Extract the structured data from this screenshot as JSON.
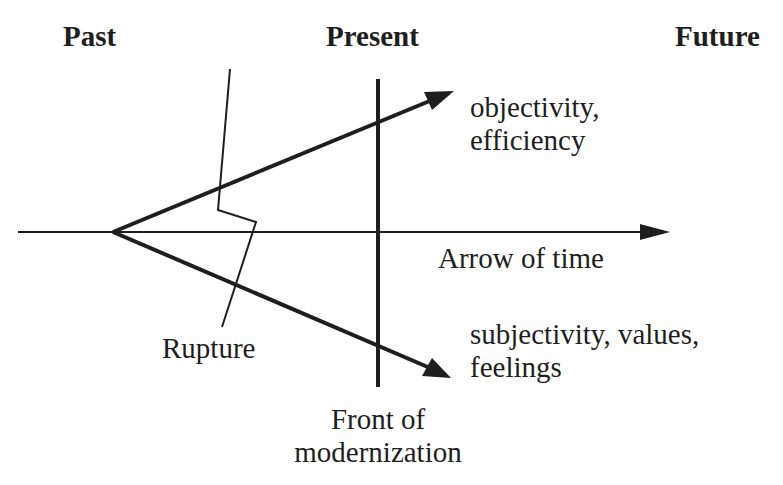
{
  "headers": {
    "past": "Past",
    "present": "Present",
    "future": "Future"
  },
  "labels": {
    "upper_arrow_line1": "objectivity,",
    "upper_arrow_line2": "efficiency",
    "time_axis": "Arrow of time",
    "lower_arrow_line1": "subjectivity, values,",
    "lower_arrow_line2": "feelings",
    "rupture": "Rupture",
    "front_line1": "Front of",
    "front_line2": "modernization"
  },
  "colors": {
    "ink": "#1e1e1e",
    "background": "#ffffff"
  }
}
